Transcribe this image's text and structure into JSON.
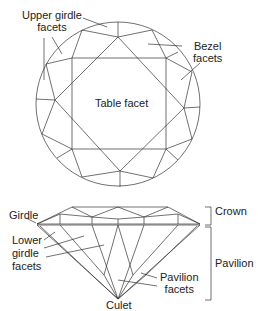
{
  "top_view": {
    "labels": {
      "upper_girdle_line1": "Upper girdle",
      "upper_girdle_line2": "facets",
      "bezel_line1": "Bezel",
      "bezel_line2": "facets",
      "table": "Table facet"
    }
  },
  "side_view": {
    "labels": {
      "girdle": "Girdle",
      "lower_girdle_line1": "Lower",
      "lower_girdle_line2": "girdle",
      "lower_girdle_line3": "facets",
      "pavilion_facets_line1": "Pavilion",
      "pavilion_facets_line2": "facets",
      "culet": "Culet",
      "crown": "Crown",
      "pavilion": "Pavilion"
    }
  },
  "colors": {
    "stroke": "#333333",
    "text": "#222222"
  }
}
